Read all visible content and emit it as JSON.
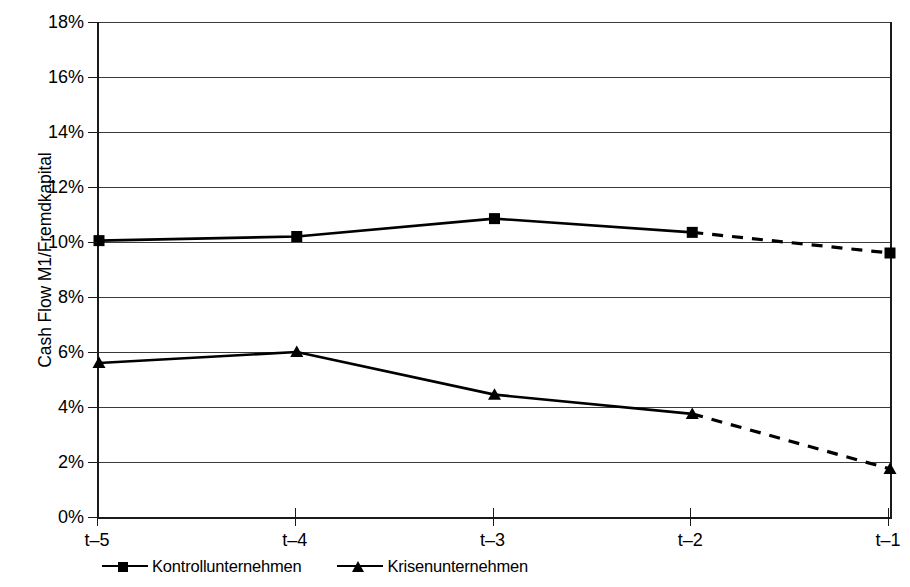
{
  "chart_data": {
    "type": "line",
    "title": "",
    "xlabel": "",
    "ylabel": "Cash Flow M1/Fremdkapital",
    "categories": [
      "t–5",
      "t–4",
      "t–3",
      "t–2",
      "t–1"
    ],
    "ylim": [
      0,
      18
    ],
    "ytick_labels": [
      "0%",
      "2%",
      "4%",
      "6%",
      "8%",
      "10%",
      "12%",
      "14%",
      "16%",
      "18%"
    ],
    "ytick_values": [
      0,
      2,
      4,
      6,
      8,
      10,
      12,
      14,
      16,
      18
    ],
    "grid": true,
    "legend_position": "below-left",
    "series": [
      {
        "name": "Kontrollunternehmen",
        "marker": "square",
        "color": "#000000",
        "values": [
          10.05,
          10.2,
          10.85,
          10.35,
          9.6
        ],
        "dashed_from_index": 3
      },
      {
        "name": "Krisenunternehmen",
        "marker": "triangle",
        "color": "#000000",
        "values": [
          5.6,
          6.0,
          4.45,
          3.75,
          1.75
        ],
        "dashed_from_index": 3
      }
    ]
  },
  "legend": {
    "entries": [
      {
        "label": "Kontrollunternehmen",
        "marker": "square-marker-icon"
      },
      {
        "label": "Krisenunternehmen",
        "marker": "triangle-marker-icon"
      }
    ]
  },
  "axis": {
    "y_title": "Cash Flow M1/Fremdkapital"
  }
}
